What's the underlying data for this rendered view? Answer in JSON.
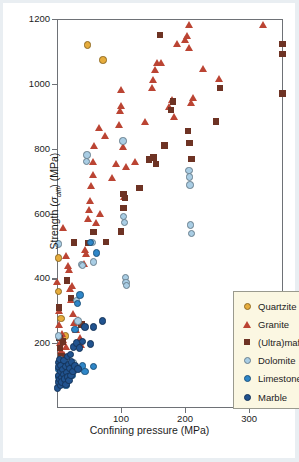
{
  "chart_data": {
    "type": "scatter",
    "title": "",
    "xlabel": "Confining pressure (MPa)",
    "ylabel": "Strength (σdiff) (MPa)",
    "ylabel_main": "Strength (",
    "ylabel_sym": "σ",
    "ylabel_sub": "diff",
    "ylabel_tail": ") (MPa)",
    "xlim": [
      0,
      353
    ],
    "ylim": [
      0,
      1200
    ],
    "xticks": [
      100,
      200,
      300
    ],
    "yticks": [
      200,
      400,
      600,
      800,
      1000,
      1200
    ],
    "grid": false,
    "legend_position": "bottom-right",
    "colors": {
      "quartzite": "#e6ac3c",
      "granite": "#bb4433",
      "ultramafics": "#6e3324",
      "dolomite": "#a9cde4",
      "limestone": "#2e86c8",
      "marble": "#21538f",
      "frame": "#6e7176",
      "legend_bg": "#fbf7e2",
      "legend_border": "#9a9a8e",
      "text": "#1c1c1c"
    },
    "series": [
      {
        "name": "Quartzite",
        "marker": "circle",
        "color": "#e6ac3c",
        "points": [
          [
            2,
            463
          ],
          [
            2,
            360
          ],
          [
            6,
            277
          ],
          [
            13,
            222
          ],
          [
            48,
            1120
          ],
          [
            72,
            1073
          ]
        ]
      },
      {
        "name": "Granite",
        "marker": "triangle",
        "color": "#bb4433",
        "points": [
          [
            1,
            390
          ],
          [
            3,
            300
          ],
          [
            4,
            255
          ],
          [
            5,
            200
          ],
          [
            6,
            176
          ],
          [
            7,
            150
          ],
          [
            8,
            230
          ],
          [
            10,
            210
          ],
          [
            11,
            165
          ],
          [
            12,
            140
          ],
          [
            14,
            190
          ],
          [
            10,
            555
          ],
          [
            14,
            470
          ],
          [
            17,
            438
          ],
          [
            19,
            425
          ],
          [
            20,
            366
          ],
          [
            22,
            332
          ],
          [
            24,
            378
          ],
          [
            26,
            290
          ],
          [
            27,
            263
          ],
          [
            30,
            240
          ],
          [
            33,
            272
          ],
          [
            36,
            215
          ],
          [
            38,
            195
          ],
          [
            42,
            445
          ],
          [
            44,
            487
          ],
          [
            46,
            476
          ],
          [
            48,
            583
          ],
          [
            50,
            612
          ],
          [
            52,
            640
          ],
          [
            54,
            684
          ],
          [
            56,
            720
          ],
          [
            57,
            760
          ],
          [
            58,
            810
          ],
          [
            62,
            570
          ],
          [
            66,
            864
          ],
          [
            68,
            600
          ],
          [
            75,
            838
          ],
          [
            86,
            710
          ],
          [
            92,
            752
          ],
          [
            97,
            872
          ],
          [
            99,
            917
          ],
          [
            100,
            932
          ],
          [
            101,
            980
          ],
          [
            103,
            806
          ],
          [
            105,
            652
          ],
          [
            108,
            745
          ],
          [
            122,
            758
          ],
          [
            137,
            884
          ],
          [
            148,
            988
          ],
          [
            151,
            1013
          ],
          [
            153,
            1042
          ],
          [
            157,
            1066
          ],
          [
            163,
            1065
          ],
          [
            176,
            928
          ],
          [
            180,
            949
          ],
          [
            183,
            898
          ],
          [
            188,
            1122
          ],
          [
            200,
            1135
          ],
          [
            204,
            1148
          ],
          [
            206,
            1111
          ],
          [
            207,
            1183
          ],
          [
            209,
            940
          ],
          [
            213,
            956
          ],
          [
            228,
            1045
          ],
          [
            253,
            1015
          ],
          [
            322,
            1183
          ]
        ]
      },
      {
        "name": "(Ultra)mafics",
        "marker": "square",
        "color": "#6e3324",
        "points": [
          [
            3,
            310
          ],
          [
            4,
            215
          ],
          [
            5,
            185
          ],
          [
            7,
            160
          ],
          [
            9,
            205
          ],
          [
            16,
            393
          ],
          [
            22,
            340
          ],
          [
            27,
            510
          ],
          [
            38,
            258
          ],
          [
            49,
            509
          ],
          [
            57,
            543
          ],
          [
            77,
            512
          ],
          [
            100,
            545
          ],
          [
            104,
            617
          ],
          [
            104,
            661
          ],
          [
            106,
            647
          ],
          [
            129,
            678
          ],
          [
            144,
            766
          ],
          [
            151,
            773
          ],
          [
            155,
            752
          ],
          [
            161,
            1150
          ],
          [
            168,
            810
          ],
          [
            178,
            920
          ],
          [
            181,
            946
          ],
          [
            205,
            855
          ],
          [
            207,
            818
          ],
          [
            210,
            768
          ],
          [
            248,
            884
          ],
          [
            255,
            988
          ],
          [
            352,
            1122
          ],
          [
            352,
            1092
          ],
          [
            352,
            970
          ]
        ]
      },
      {
        "name": "Dolomite",
        "marker": "circle",
        "color": "#a9cde4",
        "points": [
          [
            2,
            506
          ],
          [
            2,
            222
          ],
          [
            5,
            150
          ],
          [
            9,
            118
          ],
          [
            15,
            145
          ],
          [
            22,
            128
          ],
          [
            25,
            140
          ],
          [
            30,
            332
          ],
          [
            33,
            268
          ],
          [
            38,
            442
          ],
          [
            40,
            440
          ],
          [
            46,
            760
          ],
          [
            47,
            780
          ],
          [
            55,
            510
          ],
          [
            57,
            450
          ],
          [
            103,
            824
          ],
          [
            104,
            590
          ],
          [
            105,
            572
          ],
          [
            107,
            403
          ],
          [
            108,
            388
          ],
          [
            109,
            378
          ],
          [
            206,
            732
          ],
          [
            207,
            712
          ],
          [
            208,
            688
          ],
          [
            209,
            565
          ],
          [
            210,
            538
          ]
        ]
      },
      {
        "name": "Limestone",
        "marker": "circle",
        "color": "#2e86c8",
        "points": [
          [
            2,
            118
          ],
          [
            3,
            96
          ],
          [
            5,
            85
          ],
          [
            7,
            110
          ],
          [
            8,
            78
          ],
          [
            10,
            128
          ],
          [
            12,
            92
          ],
          [
            14,
            70
          ],
          [
            16,
            105
          ],
          [
            18,
            88
          ],
          [
            20,
            120
          ],
          [
            24,
            100
          ],
          [
            28,
            243
          ],
          [
            32,
            322
          ],
          [
            36,
            348
          ],
          [
            40,
            130
          ],
          [
            44,
            112
          ],
          [
            52,
            510
          ],
          [
            57,
            128
          ],
          [
            62,
            478
          ]
        ]
      },
      {
        "name": "Marble",
        "marker": "circle",
        "color": "#21538f",
        "points": [
          [
            1,
            62
          ],
          [
            2,
            80
          ],
          [
            2,
            140
          ],
          [
            3,
            100
          ],
          [
            3,
            126
          ],
          [
            4,
            88
          ],
          [
            4,
            150
          ],
          [
            5,
            70
          ],
          [
            5,
            112
          ],
          [
            6,
            132
          ],
          [
            7,
            95
          ],
          [
            8,
            80
          ],
          [
            9,
            118
          ],
          [
            10,
            104
          ],
          [
            11,
            146
          ],
          [
            12,
            90
          ],
          [
            13,
            128
          ],
          [
            14,
            72
          ],
          [
            15,
            110
          ],
          [
            16,
            158
          ],
          [
            17,
            96
          ],
          [
            18,
            135
          ],
          [
            19,
            84
          ],
          [
            20,
            122
          ],
          [
            21,
            165
          ],
          [
            22,
            100
          ],
          [
            23,
            142
          ],
          [
            25,
            112
          ],
          [
            26,
            188
          ],
          [
            28,
            130
          ],
          [
            30,
            200
          ],
          [
            33,
            120
          ],
          [
            35,
            185
          ],
          [
            40,
            205
          ],
          [
            44,
            250
          ],
          [
            52,
            198
          ],
          [
            57,
            250
          ],
          [
            71,
            268
          ]
        ]
      }
    ]
  },
  "axes": {
    "yticklabels": [
      "200",
      "400",
      "600",
      "800",
      "1000",
      "1200"
    ],
    "xticklabels": [
      "100",
      "200",
      "300"
    ]
  },
  "legend": {
    "entries": [
      {
        "label": "Quartzite",
        "marker": "circle",
        "color": "#e6ac3c"
      },
      {
        "label": "Granite",
        "marker": "triangle",
        "color": "#bb4433"
      },
      {
        "label": "(Ultra)mafics",
        "marker": "square",
        "color": "#6e3324"
      },
      {
        "label": "Dolomite",
        "marker": "circle",
        "color": "#a9cde4"
      },
      {
        "label": "Limestone",
        "marker": "circle",
        "color": "#2e86c8"
      },
      {
        "label": "Marble",
        "marker": "circle",
        "color": "#21538f"
      }
    ]
  }
}
